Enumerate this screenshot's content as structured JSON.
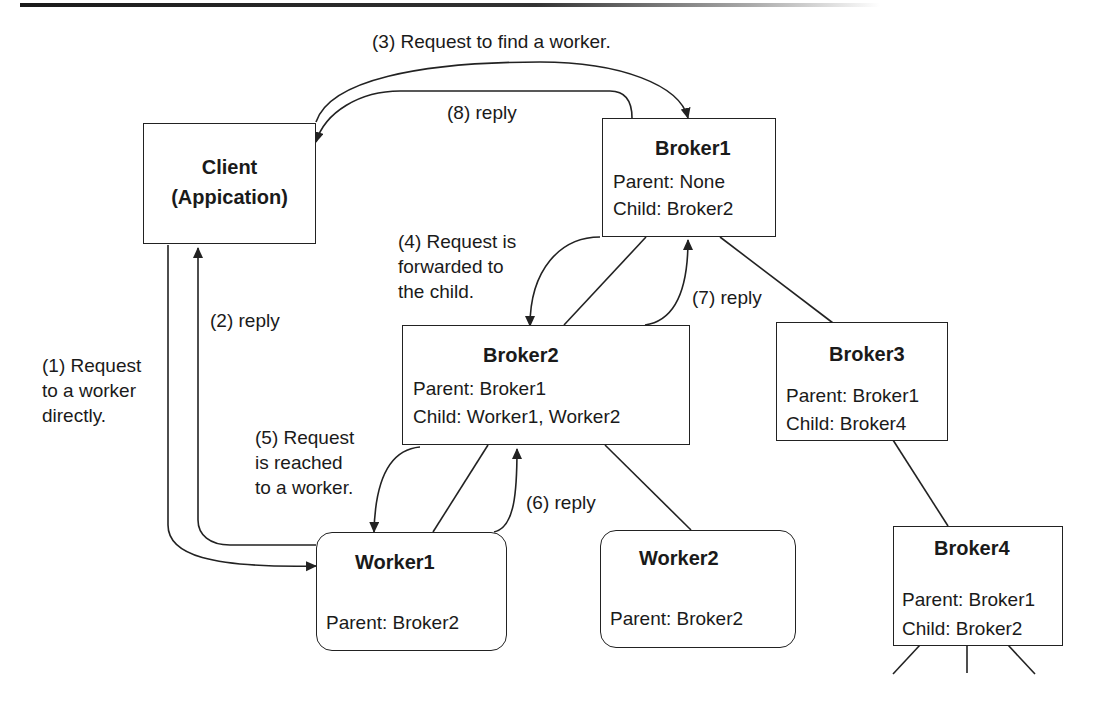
{
  "nodes": {
    "client": {
      "title": "Client",
      "subtitle": "(Appication)"
    },
    "broker1": {
      "title": "Broker1",
      "parent": "Parent: None",
      "child": "Child: Broker2"
    },
    "broker2": {
      "title": "Broker2",
      "parent": "Parent: Broker1",
      "child": "Child: Worker1, Worker2"
    },
    "broker3": {
      "title": "Broker3",
      "parent": "Parent: Broker1",
      "child": "Child: Broker4"
    },
    "broker4": {
      "title": "Broker4",
      "parent": "Parent: Broker1",
      "child": "Child: Broker2"
    },
    "worker1": {
      "title": "Worker1",
      "parent": "Parent: Broker2"
    },
    "worker2": {
      "title": "Worker2",
      "parent": "Parent: Broker2"
    }
  },
  "steps": {
    "s1": [
      "(1) Request",
      "to a worker",
      "directly."
    ],
    "s2": "(2) reply",
    "s3": "(3) Request to find a worker.",
    "s4": [
      "(4) Request is",
      "forwarded to",
      "the child."
    ],
    "s5": [
      "(5) Request",
      "is reached",
      "to a worker."
    ],
    "s6": "(6) reply",
    "s7": "(7) reply",
    "s8": "(8) reply"
  },
  "colors": {
    "stroke": "#222222",
    "background": "#ffffff",
    "text": "#1a1a1a"
  }
}
